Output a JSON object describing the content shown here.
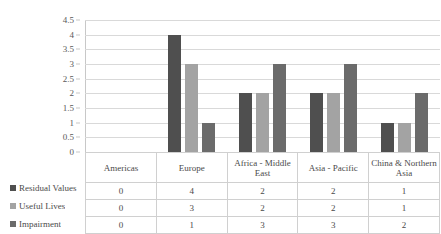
{
  "chart_data": {
    "type": "bar",
    "title": "",
    "xlabel": "",
    "ylabel": "",
    "ylim": [
      0,
      4.5
    ],
    "grid": true,
    "legend_position": "table-left",
    "categories": [
      "Americas",
      "Europe",
      "Africa - Middle East",
      "Asia - Pacific",
      "China & Northern Asia"
    ],
    "y_ticks": [
      "0",
      "0.5",
      "1",
      "1.5",
      "2",
      "2.5",
      "3",
      "3.5",
      "4",
      "4.5"
    ],
    "series": [
      {
        "name": "Residual Values",
        "values": [
          0,
          4,
          2,
          2,
          1
        ],
        "color": "#4f4f4f"
      },
      {
        "name": "Useful Lives",
        "values": [
          0,
          3,
          2,
          2,
          1
        ],
        "color": "#a3a3a3"
      },
      {
        "name": "Impairment",
        "values": [
          0,
          1,
          3,
          3,
          2
        ],
        "color": "#6b6b6b"
      }
    ]
  },
  "table": {
    "headers": [
      "Americas",
      "Europe",
      "Africa - Middle East",
      "Asia - Pacific",
      "China & Northern Asia"
    ],
    "rows": [
      {
        "label": "Residual Values",
        "values": [
          "0",
          "4",
          "2",
          "2",
          "1"
        ]
      },
      {
        "label": "Useful Lives",
        "values": [
          "0",
          "3",
          "2",
          "2",
          "1"
        ]
      },
      {
        "label": "Impairment",
        "values": [
          "0",
          "1",
          "3",
          "3",
          "2"
        ]
      }
    ]
  }
}
